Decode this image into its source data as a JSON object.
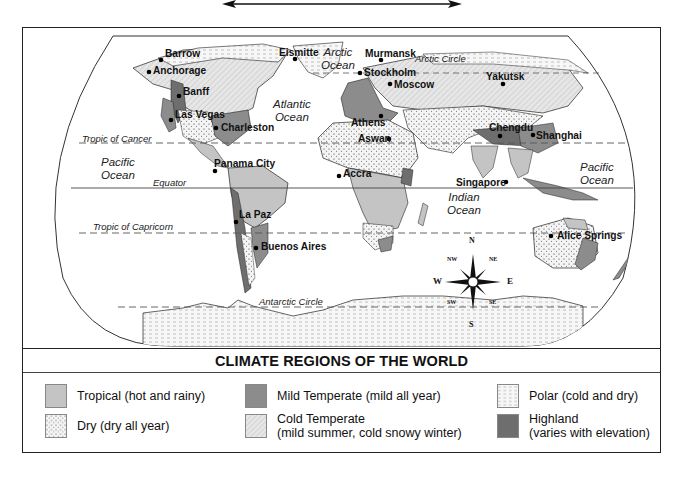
{
  "map": {
    "title": "CLIMATE REGIONS OF THE WORLD",
    "cities": [
      {
        "name": "Barrow",
        "x": 160,
        "y": 54
      },
      {
        "name": "Anchorage",
        "x": 150,
        "y": 70
      },
      {
        "name": "Banff",
        "x": 180,
        "y": 91
      },
      {
        "name": "Las Vegas",
        "x": 174,
        "y": 112
      },
      {
        "name": "Charleston",
        "x": 216,
        "y": 128
      },
      {
        "name": "Eismitte",
        "x": 295,
        "y": 57
      },
      {
        "name": "Murmansk",
        "x": 375,
        "y": 59
      },
      {
        "name": "Stockholm",
        "x": 360,
        "y": 73
      },
      {
        "name": "Moscow",
        "x": 390,
        "y": 83
      },
      {
        "name": "Yakutsk",
        "x": 505,
        "y": 78
      },
      {
        "name": "Athens",
        "x": 375,
        "y": 121
      },
      {
        "name": "Aswan",
        "x": 390,
        "y": 138
      },
      {
        "name": "Chengdu",
        "x": 500,
        "y": 134
      },
      {
        "name": "Shanghai",
        "x": 530,
        "y": 135
      },
      {
        "name": "Panama City",
        "x": 213,
        "y": 163
      },
      {
        "name": "Accra",
        "x": 340,
        "y": 172
      },
      {
        "name": "Singapore",
        "x": 506,
        "y": 180
      },
      {
        "name": "La Paz",
        "x": 238,
        "y": 213
      },
      {
        "name": "Buenos Aires",
        "x": 257,
        "y": 252
      },
      {
        "name": "Alice Springs",
        "x": 552,
        "y": 238
      }
    ],
    "oceans": [
      {
        "name": "Arctic\nOcean",
        "x": 322,
        "y": 48
      },
      {
        "name": "Atlantic\nOcean",
        "x": 293,
        "y": 93
      },
      {
        "name": "Pacific\nOcean",
        "x": 120,
        "y": 160
      },
      {
        "name": "Indian\nOcean",
        "x": 470,
        "y": 193
      },
      {
        "name": "Pacific\nOcean",
        "x": 600,
        "y": 163
      }
    ],
    "lines": {
      "arctic_circle": "Arctic Circle",
      "tropic_of_cancer": "Tropic of Cancer",
      "equator": "Equator",
      "tropic_of_capricorn": "Tropic of Capricorn",
      "antarctic_circle": "Antarctic Circle"
    },
    "compass": {
      "n": "N",
      "ne": "NE",
      "e": "E",
      "se": "SE",
      "s": "S",
      "sw": "SW",
      "w": "W",
      "nw": "NW"
    }
  },
  "legend": {
    "items": [
      {
        "label": "Tropical (hot and rainy)",
        "pattern": "tropical",
        "color": "#c4c4c4"
      },
      {
        "label": "Dry (dry all year)",
        "pattern": "dry",
        "color": "#f2f2f2"
      },
      {
        "label": "Mild Temperate (mild all year)",
        "pattern": "mild",
        "color": "#8c8c8c"
      },
      {
        "label": "Cold Temperate",
        "sublabel": "(mild summer, cold snowy winter)",
        "pattern": "cold",
        "color": "#e3e3e3"
      },
      {
        "label": "Polar (cold and dry)",
        "pattern": "polar",
        "color": "#f5f5f5"
      },
      {
        "label": "Highland",
        "sublabel": "(varies with elevation)",
        "pattern": "highland",
        "color": "#6e6e6e"
      }
    ]
  },
  "colors": {
    "tropical": "#c4c4c4",
    "dry": "#f2f2f2",
    "mild": "#8c8c8c",
    "cold": "#e3e3e3",
    "polar": "#f5f5f5",
    "highland": "#6e6e6e",
    "ink": "#222222"
  }
}
